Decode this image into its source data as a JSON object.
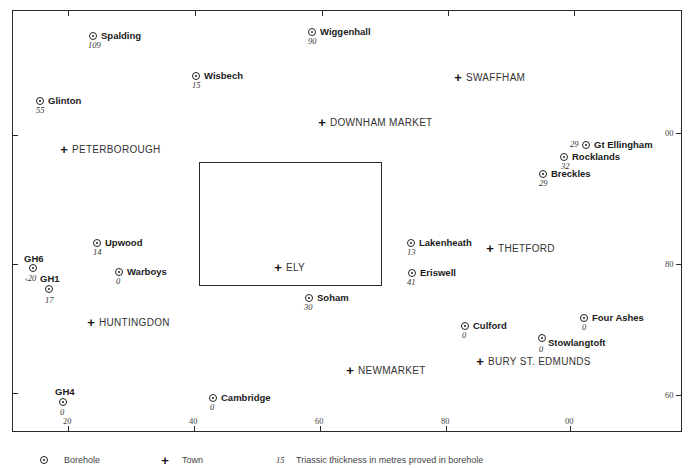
{
  "map": {
    "x_axis_ticks": [
      "20",
      "40",
      "60",
      "80",
      "00"
    ],
    "y_axis_ticks": [
      "00",
      "80",
      "60"
    ],
    "boreholes": [
      {
        "name": "Spalding",
        "thickness": "109"
      },
      {
        "name": "Wiggenhall",
        "thickness": "90"
      },
      {
        "name": "Wisbech",
        "thickness": "15"
      },
      {
        "name": "Glinton",
        "thickness": "55"
      },
      {
        "name": "Gt Ellingham",
        "thickness": "29"
      },
      {
        "name": "Rocklands",
        "thickness": "32"
      },
      {
        "name": "Breckles",
        "thickness": "29"
      },
      {
        "name": "Upwood",
        "thickness": "14"
      },
      {
        "name": "GH6",
        "thickness": "‹20"
      },
      {
        "name": "GH1",
        "thickness": "17"
      },
      {
        "name": "Warboys",
        "thickness": "0"
      },
      {
        "name": "Lakenheath",
        "thickness": "13"
      },
      {
        "name": "Eriswell",
        "thickness": "41"
      },
      {
        "name": "Soham",
        "thickness": "30"
      },
      {
        "name": "Four Ashes",
        "thickness": "0"
      },
      {
        "name": "Culford",
        "thickness": "0"
      },
      {
        "name": "Stowlangtoft",
        "thickness": "0"
      },
      {
        "name": "GH4",
        "thickness": "0"
      },
      {
        "name": "Cambridge",
        "thickness": "0"
      }
    ],
    "towns": [
      "SWAFFHAM",
      "DOWNHAM MARKET",
      "PETERBOROUGH",
      "THETFORD",
      "ELY",
      "HUNTINGDON",
      "NEWMARKET",
      "BURY ST. EDMUNDS"
    ]
  },
  "legend": {
    "borehole_label": "Borehole",
    "town_label": "Town",
    "thickness_example": "15",
    "thickness_label": "Triassic thickness in metres proved in borehole"
  }
}
